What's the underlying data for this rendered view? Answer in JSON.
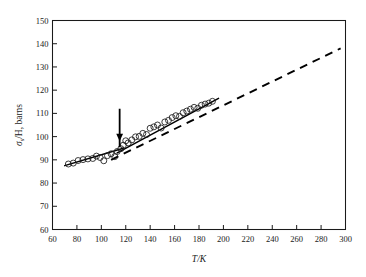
{
  "figure": {
    "name": "neutron-scattering-cross-section-vs-temperature",
    "background": "#ffffff",
    "ink_color": "#1a1a1a"
  },
  "chart_data": {
    "type": "scatter",
    "title": "",
    "subtitle": "",
    "xlabel": "T/K",
    "ylabel": "σs/H, barns",
    "ylabel_symbol": "σ",
    "ylabel_subscript": "s",
    "ylabel_rest": "/H, barns",
    "xlim": [
      60,
      300
    ],
    "ylim": [
      60,
      150
    ],
    "xticks": [
      60,
      80,
      100,
      120,
      140,
      160,
      180,
      200,
      220,
      240,
      260,
      280,
      300
    ],
    "yticks": [
      60,
      70,
      80,
      90,
      100,
      110,
      120,
      130,
      140,
      150
    ],
    "xtick_labels": [
      "60",
      "80",
      "100",
      "120",
      "140",
      "160",
      "180",
      "200",
      "220",
      "240",
      "260",
      "280",
      "300"
    ],
    "ytick_labels": [
      "60",
      "70",
      "80",
      "90",
      "100",
      "110",
      "120",
      "130",
      "140",
      "150"
    ],
    "grid": false,
    "legend": "none",
    "tick_direction": "in",
    "series": [
      {
        "name": "measured-cross-section",
        "marker": "open-circle",
        "marker_size": 3.0,
        "x": [
          73,
          77,
          81,
          85,
          89,
          93,
          96,
          99,
          102,
          105,
          108,
          111,
          113,
          116,
          118,
          120,
          122,
          125,
          128,
          131,
          134,
          137,
          140,
          143,
          146,
          149,
          152,
          155,
          158,
          161,
          164,
          167,
          170,
          173,
          176,
          179,
          182,
          185,
          188,
          191
        ],
        "y": [
          88.2,
          88.6,
          89.7,
          90.1,
          90.4,
          90.6,
          91.6,
          91.0,
          89.6,
          91.8,
          92.6,
          91.4,
          93.6,
          94.8,
          96.3,
          98.2,
          97.3,
          98.6,
          99.9,
          100.1,
          101.4,
          100.9,
          103.6,
          104.2,
          105.0,
          103.7,
          106.3,
          107.0,
          108.2,
          109.0,
          108.7,
          110.3,
          111.0,
          111.8,
          112.6,
          112.2,
          113.5,
          114.0,
          114.4,
          115.2
        ]
      }
    ],
    "annotations": [
      {
        "name": "transition-arrow",
        "type": "down-arrow",
        "x": 115,
        "y_tail": 112,
        "y_head": 98,
        "label": ""
      },
      {
        "name": "low-temperature-fit",
        "type": "solid-line",
        "x1": 70,
        "y1": 87.5,
        "x2": 118,
        "y2": 95.0
      },
      {
        "name": "high-temperature-fit",
        "type": "solid-line",
        "x1": 113,
        "y1": 93.0,
        "x2": 196,
        "y2": 116.5
      },
      {
        "name": "extrapolated-trend",
        "type": "dashed-line",
        "x1": 108,
        "y1": 90.0,
        "x2": 296,
        "y2": 138.0
      }
    ]
  }
}
